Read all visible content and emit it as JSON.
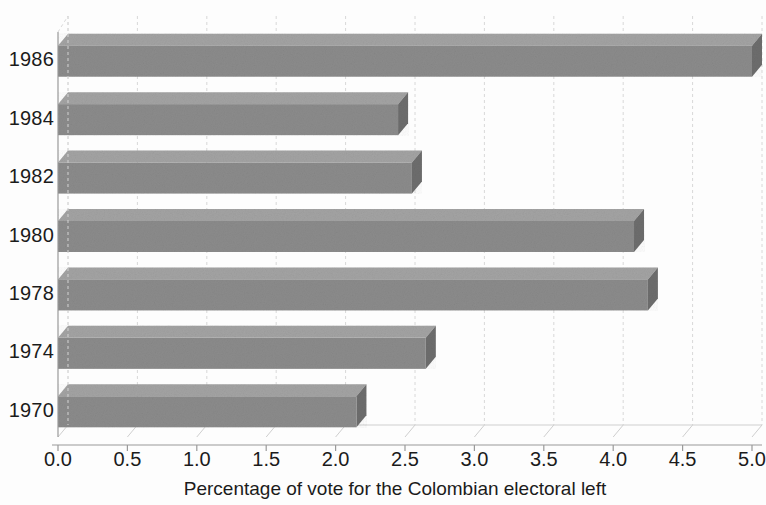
{
  "chart_data": {
    "type": "bar",
    "orientation": "horizontal",
    "style": "3d",
    "title": "",
    "subtitle": "",
    "xlabel": "Percentage of vote for the Colombian electoral left",
    "ylabel": "",
    "categories": [
      "1986",
      "1984",
      "1982",
      "1980",
      "1978",
      "1974",
      "1970"
    ],
    "values": [
      5.0,
      2.45,
      2.55,
      4.15,
      4.25,
      2.65,
      2.15
    ],
    "series": [
      {
        "name": "Percentage of vote for the Colombian electoral left",
        "values": [
          5.0,
          2.45,
          2.55,
          4.15,
          4.25,
          2.65,
          2.15
        ]
      }
    ],
    "xlim": [
      0.0,
      5.0
    ],
    "xticks": [
      0.0,
      0.5,
      1.0,
      1.5,
      2.0,
      2.5,
      3.0,
      3.5,
      4.0,
      4.5,
      5.0
    ],
    "xtick_labels": [
      "0.0",
      "0.5",
      "1.0",
      "1.5",
      "2.0",
      "2.5",
      "3.0",
      "3.5",
      "4.0",
      "4.5",
      "5.0"
    ],
    "ytick_labels": [
      "1986",
      "1984",
      "1982",
      "1980",
      "1978",
      "1974",
      "1970"
    ],
    "grid": true,
    "grid_axis": "x",
    "legend": false,
    "legend_position": "none",
    "bar_color": "#8b8b8b",
    "bar_top_color": "#a3a3a3",
    "bar_side_color": "#6d6d6d",
    "grid_color": "#d8d8d8",
    "axis_color": "#9a9a9a",
    "text_color": "#1b1b1b",
    "background_color": "#ffffff"
  },
  "axes": {
    "x_title": "Percentage of vote for the Colombian electoral left"
  }
}
